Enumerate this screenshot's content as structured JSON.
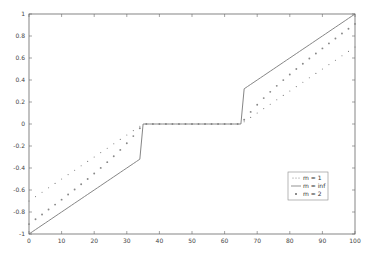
{
  "chart_data": {
    "type": "line",
    "title": "",
    "xlabel": "",
    "ylabel": "",
    "xlim": [
      0,
      100
    ],
    "ylim": [
      -1,
      1
    ],
    "grid": false,
    "legend_position": "lower right (inside)",
    "x_ticks": [
      0,
      10,
      20,
      30,
      40,
      50,
      60,
      70,
      80,
      90,
      100
    ],
    "x_tick_labels": [
      "0",
      "10",
      "20",
      "30",
      "40",
      "50",
      "60",
      "70",
      "80",
      "90",
      "100"
    ],
    "y_ticks": [
      -1,
      -0.8,
      -0.6,
      -0.4,
      -0.2,
      0,
      0.2,
      0.4,
      0.6,
      0.8,
      1
    ],
    "y_tick_labels": [
      "-1",
      "-0.8",
      "-0.6",
      "-0.4",
      "-0.2",
      "0",
      "0.2",
      "0.4",
      "0.6",
      "0.8",
      "1"
    ],
    "threshold": 0.3,
    "series": [
      {
        "name": "m = 1",
        "style": "dotted small dots",
        "description": "soft threshold: y = sign(u)(|u|-0.3) for |u|>0.3 else 0, u=(x-50)/50",
        "key_points": [
          [
            0,
            -0.7
          ],
          [
            35,
            0
          ],
          [
            65,
            0
          ],
          [
            100,
            0.7
          ]
        ]
      },
      {
        "name": "m = inf",
        "style": "solid line",
        "description": "hard threshold: y = u for |u|>0.3 else 0, u=(x-50)/50",
        "key_points": [
          [
            0,
            -1
          ],
          [
            34,
            -0.32
          ],
          [
            35,
            0
          ],
          [
            65,
            0
          ],
          [
            66,
            0.32
          ],
          [
            100,
            1
          ]
        ]
      },
      {
        "name": "m = 2",
        "style": "dotted larger markers",
        "description": "garrote: y = u - 0.09/u for |u|>0.3 else 0, u=(x-50)/50",
        "key_points": [
          [
            0,
            -0.91
          ],
          [
            35,
            0
          ],
          [
            65,
            0
          ],
          [
            100,
            0.91
          ]
        ]
      }
    ]
  },
  "legend": {
    "items": [
      {
        "label": "m = 1"
      },
      {
        "label": "m = inf"
      },
      {
        "label": "m = 2"
      }
    ]
  }
}
